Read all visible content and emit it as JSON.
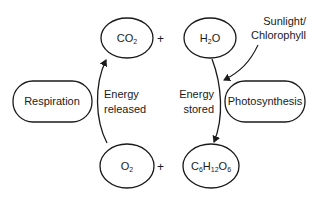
{
  "diagram": {
    "nodes": {
      "co2": {
        "main": "CO",
        "sub": "2"
      },
      "h2o": {
        "pre": "H",
        "sub": "2",
        "post": "O"
      },
      "o2": {
        "main": "O",
        "sub": "2"
      },
      "glucose": {
        "c": "C",
        "c_sub": "6",
        "h": "H",
        "h_sub": "12",
        "o": "O",
        "o_sub": "6"
      },
      "respiration": "Respiration",
      "photosynthesis": "Photosynthesis"
    },
    "operators": {
      "top_plus": "+",
      "bottom_plus": "+"
    },
    "edge_labels": {
      "energy_released_line1": "Energy",
      "energy_released_line2": "released",
      "energy_stored_line1": "Energy",
      "energy_stored_line2": "stored",
      "sunlight_line1": "Sunlight/",
      "sunlight_line2": "Chlorophyll"
    },
    "colors": {
      "stroke": "#1a1a1a",
      "background": "#ffffff"
    }
  }
}
